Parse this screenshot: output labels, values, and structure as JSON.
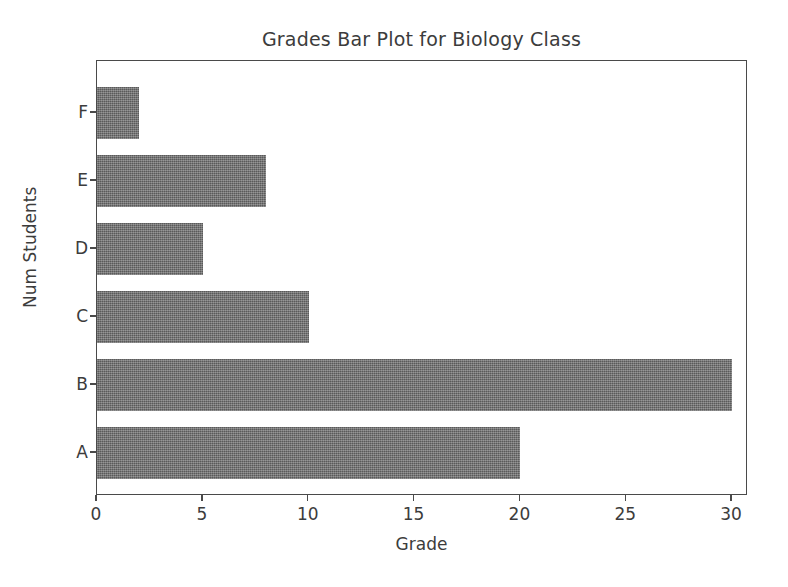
{
  "chart_data": {
    "type": "bar",
    "orientation": "horizontal",
    "title": "Grades Bar Plot for Biology Class",
    "xlabel": "Grade",
    "ylabel": "Num Students",
    "categories": [
      "F",
      "E",
      "D",
      "C",
      "B",
      "A"
    ],
    "values": [
      2,
      8,
      5,
      10,
      30,
      20
    ],
    "xticks": [
      0,
      5,
      10,
      15,
      20,
      25,
      30
    ],
    "xtick_labels": [
      "0",
      "5",
      "10",
      "15",
      "20",
      "25",
      "30"
    ],
    "xlim": [
      0,
      30.75
    ],
    "grid": false,
    "legend": null,
    "bar_color": "#6e6e6e",
    "axes_color": "#4a4a4a",
    "background_color": "#ffffff",
    "series": [
      {
        "name": "Num Students",
        "points": [
          {
            "category": "F",
            "value": 2
          },
          {
            "category": "E",
            "value": 8
          },
          {
            "category": "D",
            "value": 5
          },
          {
            "category": "C",
            "value": 10
          },
          {
            "category": "B",
            "value": 30
          },
          {
            "category": "A",
            "value": 20
          }
        ]
      }
    ]
  }
}
